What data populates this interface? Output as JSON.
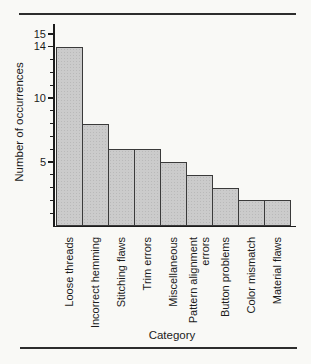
{
  "figure": {
    "page_background": "#f9f9f6",
    "rule_color": "#2d2d2d",
    "ink_color": "#1c1c1c"
  },
  "chart_data": {
    "type": "bar",
    "title": "",
    "categories": [
      "Loose threads",
      "Incorrect hemming",
      "Stitching flaws",
      "Trim errors",
      "Miscellaneous",
      "Pattern alignment errors",
      "Button problems",
      "Color mismatch",
      "Material flaws"
    ],
    "category_labels": [
      "Loose threads",
      "Incorrect hemming",
      "Stitching flaws",
      "Trim errors",
      "Miscellaneous",
      "Pattern alignment\nerrors",
      "Button problems",
      "Color mismatch",
      "Material flaws"
    ],
    "values": [
      14,
      8,
      6,
      6,
      5,
      4,
      3,
      2,
      2
    ],
    "xlabel": "Category",
    "ylabel": "Number of occurrences",
    "ylim": [
      0,
      15
    ],
    "yticks_labeled": [
      5,
      10,
      14,
      15
    ],
    "ytick_minor_step": 1,
    "grid": false,
    "legend": false,
    "bar_fill": "#cbcbcb",
    "bar_dot": "#b9b9b9",
    "bar_border": "#3a3a3a"
  }
}
